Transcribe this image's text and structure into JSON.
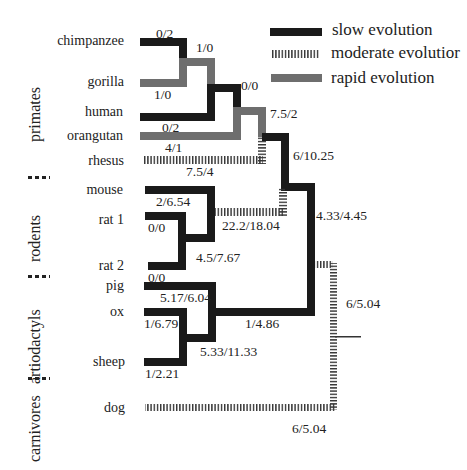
{
  "legend": {
    "items": [
      {
        "label": "slow evolution",
        "style": "slow",
        "color": "#1a1a1a"
      },
      {
        "label": "moderate evolutior",
        "style": "moderate",
        "color": "#333333"
      },
      {
        "label": "rapid evolution",
        "style": "rapid",
        "color": "#6e6e6e"
      }
    ]
  },
  "groups": [
    "primates",
    "rodents",
    "artiodactyls",
    "carnivores"
  ],
  "taxa": [
    "chimpanzee",
    "gorilla",
    "human",
    "orangutan",
    "rhesus",
    "mouse",
    "rat 1",
    "rat 2",
    "pig",
    "ox",
    "sheep",
    "dog"
  ],
  "branch_labels": {
    "chimpanzee": "0/2",
    "gorilla": "1/0",
    "chimp_gorilla": "1/0",
    "human": "0/2",
    "hominines": "0/0",
    "orangutan": "4/1",
    "great_apes": "7.5/2",
    "rhesus": "7.5/4",
    "primates": "6/10.25",
    "mouse": "2/6.54",
    "rat1": "0/0",
    "rat2": "0/0",
    "murids": "4.5/7.67",
    "rodents": "22.2/18.04",
    "euarchontoglires": "4.33/4.45",
    "pig": "5.17/6.04",
    "ox": "1/6.79",
    "sheep": "1/2.21",
    "ruminants": "5.33/11.33",
    "artiodactyls": "1/4.86",
    "root": "6/5.04",
    "dog": "6/5.04"
  }
}
